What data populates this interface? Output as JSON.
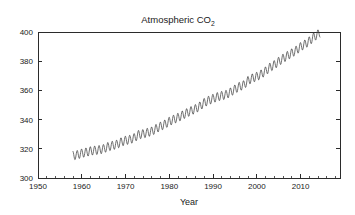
{
  "chart_data": {
    "type": "line",
    "title": "Atmospheric CO2",
    "title_main": "Atmospheric CO",
    "title_sub": "2",
    "xlabel": "Year",
    "ylabel": "",
    "xlim": [
      1950,
      2019
    ],
    "ylim": [
      300,
      400
    ],
    "xticks": [
      1950,
      1960,
      1970,
      1980,
      1990,
      2000,
      2010
    ],
    "xtick_labels": [
      "1950",
      "1960",
      "1970",
      "1980",
      "1990",
      "2000",
      "2010"
    ],
    "x_minor_step": 2,
    "yticks": [
      300,
      320,
      340,
      360,
      380,
      400
    ],
    "ytick_labels": [
      "300",
      "320",
      "340",
      "360",
      "380",
      "400"
    ],
    "grid": false,
    "legend": "none",
    "line_color": "#404040",
    "series_name": "Mauna Loa CO2 monthly mean",
    "seasonal_amplitude_ppm": 3.0,
    "data_start_year": 1958,
    "data_end_year": 2014,
    "x": [
      1958,
      1959,
      1960,
      1961,
      1962,
      1963,
      1964,
      1965,
      1966,
      1967,
      1968,
      1969,
      1970,
      1971,
      1972,
      1973,
      1974,
      1975,
      1976,
      1977,
      1978,
      1979,
      1980,
      1981,
      1982,
      1983,
      1984,
      1985,
      1986,
      1987,
      1988,
      1989,
      1990,
      1991,
      1992,
      1993,
      1994,
      1995,
      1996,
      1997,
      1998,
      1999,
      2000,
      2001,
      2002,
      2003,
      2004,
      2005,
      2006,
      2007,
      2008,
      2009,
      2010,
      2011,
      2012,
      2013,
      2014
    ],
    "values": [
      315.3,
      315.9,
      316.9,
      317.6,
      318.5,
      318.9,
      319.3,
      320.0,
      321.4,
      322.2,
      323.0,
      324.6,
      325.7,
      326.3,
      327.5,
      329.7,
      330.2,
      331.1,
      332.0,
      333.8,
      335.4,
      336.8,
      338.7,
      340.1,
      341.4,
      343.0,
      344.6,
      346.0,
      347.4,
      349.2,
      351.6,
      353.1,
      354.4,
      355.6,
      356.4,
      357.1,
      358.8,
      360.8,
      362.6,
      363.7,
      366.7,
      368.4,
      369.5,
      371.1,
      373.2,
      375.8,
      377.5,
      379.8,
      381.9,
      383.8,
      385.6,
      387.4,
      389.9,
      391.6,
      393.8,
      396.5,
      398.6
    ]
  },
  "figure": {
    "background_color": "#ffffff",
    "axis_color": "#2b2b2b"
  }
}
